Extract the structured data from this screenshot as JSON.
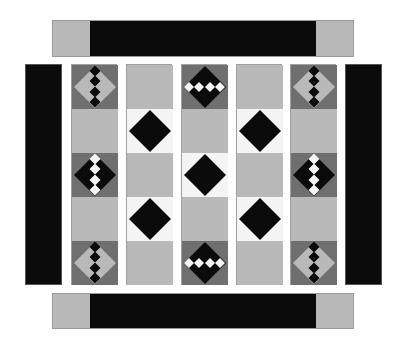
{
  "colors": {
    "black": "#0b0b0b",
    "light_gray": "#b9b9b9",
    "dark_gray": "#6f6f6f",
    "white": "#f4f4f4"
  },
  "layout": {
    "top_border": {
      "x": 52,
      "y": 20,
      "w": 302,
      "h": 37
    },
    "bottom_border": {
      "x": 52,
      "y": 293,
      "w": 302,
      "h": 36
    },
    "left_border": {
      "x": 25,
      "y": 64,
      "w": 37,
      "h": 221
    },
    "right_border": {
      "x": 345,
      "y": 64,
      "w": 37,
      "h": 221
    },
    "columns_x": [
      71,
      126,
      181,
      236,
      290
    ],
    "column_width": 46,
    "column_y": 64,
    "segment_height": 44
  },
  "columns": [
    {
      "name": "column-1",
      "segments": [
        "gray-diamond-black-chain",
        "light",
        "black-diamond-white-chain",
        "light",
        "gray-diamond-black-chain"
      ]
    },
    {
      "name": "column-2",
      "segments": [
        "light",
        "black-diamond",
        "light",
        "black-diamond",
        "light"
      ]
    },
    {
      "name": "column-3",
      "segments": [
        "black-diamond-white-row",
        "light",
        "black-diamond",
        "light",
        "black-diamond-white-row"
      ]
    },
    {
      "name": "column-4",
      "segments": [
        "light",
        "black-diamond",
        "light",
        "black-diamond",
        "light"
      ]
    },
    {
      "name": "column-5",
      "segments": [
        "gray-diamond-black-chain",
        "light",
        "black-diamond-white-chain",
        "light",
        "gray-diamond-black-chain"
      ]
    }
  ]
}
